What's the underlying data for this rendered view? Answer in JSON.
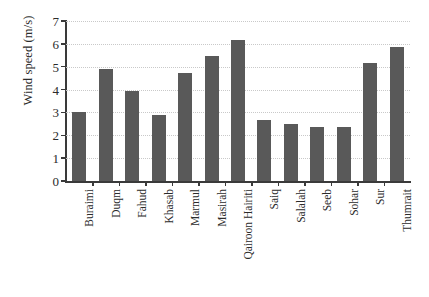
{
  "chart_data": {
    "type": "bar",
    "title": "",
    "xlabel": "",
    "ylabel": "Wind speed (m/s)",
    "ylim": [
      0,
      7
    ],
    "yticks": [
      0,
      1,
      2,
      3,
      4,
      5,
      6,
      7
    ],
    "ytick_labels": [
      "0",
      "1",
      "2",
      "3",
      "4",
      "5",
      "6",
      "7"
    ],
    "grid": true,
    "grid_style": "dotted",
    "grid_axis": "y",
    "legend": null,
    "bar_color": "#595959",
    "categories": [
      "Buraimi",
      "Duqm",
      "Fahud",
      "Khasab",
      "Marmul",
      "Masirah",
      "Qairoon Hairiti",
      "Saiq",
      "Salalah",
      "Seeb",
      "Sohar",
      "Sur",
      "Thumrait"
    ],
    "values": [
      3.0,
      4.88,
      3.92,
      2.88,
      4.72,
      5.48,
      6.18,
      2.65,
      2.48,
      2.38,
      2.38,
      5.18,
      5.85
    ]
  }
}
